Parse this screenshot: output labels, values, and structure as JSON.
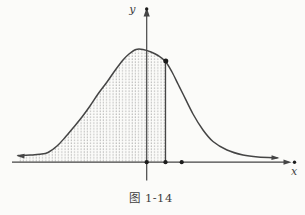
{
  "figure": {
    "caption": "图 1-14",
    "y_axis_label": "y",
    "x_axis_label": "x",
    "colors": {
      "line": "#454545",
      "dot": "#1c1c1c",
      "stipple": "#8d8d8d",
      "background": "#fbfbf9",
      "text": "#3f3f3f"
    }
  },
  "chart_data": {
    "type": "line",
    "title": "图 1-14",
    "xlabel": "x",
    "ylabel": "y",
    "has_numeric_ticks": false,
    "grid": false,
    "legend": false,
    "canvas_px": {
      "width": 305,
      "height": 215
    },
    "x_axis": {
      "y": 162.2,
      "x_start": 12,
      "x_end": 288.5,
      "arrow_tip_x": 291.5,
      "end_dot_x": 294.5
    },
    "y_axis": {
      "x": 146.7,
      "y_top": 15,
      "y_bottom": 180.5,
      "arrow_tip_y": 7.5,
      "top_dot_y": 9
    },
    "curve_points": [
      [
        18,
        155.5
      ],
      [
        30,
        155
      ],
      [
        40,
        154.3
      ],
      [
        48,
        152.5
      ],
      [
        57,
        146
      ],
      [
        65,
        137.5
      ],
      [
        73,
        128
      ],
      [
        82,
        117
      ],
      [
        90,
        106
      ],
      [
        98,
        94
      ],
      [
        107,
        82
      ],
      [
        115,
        70.5
      ],
      [
        123,
        60
      ],
      [
        129,
        54
      ],
      [
        136,
        49.5
      ],
      [
        143,
        49.5
      ],
      [
        151,
        52
      ],
      [
        158,
        55.5
      ],
      [
        165.5,
        61.5
      ],
      [
        172,
        72
      ],
      [
        178,
        84
      ],
      [
        183,
        94
      ],
      [
        193,
        114
      ],
      [
        203,
        130
      ],
      [
        213,
        141.5
      ],
      [
        227,
        150
      ],
      [
        243,
        155
      ],
      [
        258,
        157
      ],
      [
        277,
        157.8
      ]
    ],
    "shaded_region": {
      "end_x": 165.5,
      "fill_style": "stipple-dots"
    },
    "vertical_segment": {
      "x": 165.5,
      "y_top": 61.5
    },
    "curve_marked_point": {
      "x": 165.8,
      "y": 61
    },
    "axis_marked_points_x": [
      146.7,
      165.5,
      181.7
    ],
    "curve_left_arrow_tip": [
      16.5,
      155.7
    ],
    "curve_right_arrow_tip": [
      279.5,
      157.9
    ]
  }
}
